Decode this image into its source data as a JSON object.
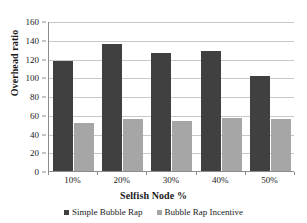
{
  "chart_data": {
    "type": "bar",
    "title": "",
    "xlabel": "Selfish Node %",
    "ylabel": "Overhead ratio",
    "categories": [
      "10%",
      "20%",
      "30%",
      "40%",
      "50%"
    ],
    "series": [
      {
        "name": "Simple Bubble Rap",
        "color": "#404040",
        "values": [
          117,
          135,
          126,
          128,
          101
        ]
      },
      {
        "name": "Bubble Rap Incentive",
        "color": "#a6a6a6",
        "values": [
          51,
          56,
          53,
          57,
          55
        ]
      }
    ],
    "ylim": [
      0,
      160
    ],
    "ytick_values": [
      0,
      20,
      40,
      60,
      80,
      100,
      120,
      140,
      160
    ],
    "ytick_labels": [
      "0",
      "20",
      "40",
      "60",
      "80",
      "100",
      "120",
      "140",
      "160"
    ],
    "grid": true,
    "legend_position": "bottom",
    "plot_background": "#ffffff",
    "gridline_color": "#c9c9c9",
    "axis_color": "#8c8c8c"
  }
}
